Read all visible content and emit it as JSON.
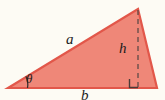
{
  "figure": {
    "kind": "right-triangle-with-altitude-diagram",
    "background_color": "#fdfbf4",
    "fill_color": "#ef8778",
    "stroke_color": "#e2574a",
    "line_color": "#5a4a46",
    "label_color": "#1b1b1b",
    "labels": {
      "side_a": "a",
      "height_h": "h",
      "base_b": "b",
      "angle_theta": "θ"
    },
    "geometry": {
      "left_vertex": [
        8,
        88
      ],
      "apex_vertex": [
        138,
        9
      ],
      "right_vertex": [
        157,
        88
      ],
      "altitude_foot": [
        138,
        88
      ],
      "right_angle_marker": [
        130,
        79,
        9,
        9
      ],
      "angle_arc_radius": 19
    }
  }
}
